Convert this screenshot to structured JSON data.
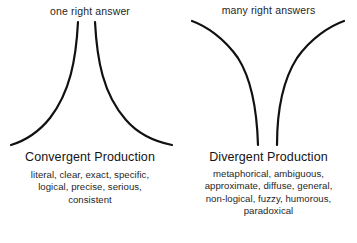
{
  "diagram": {
    "background_color": "#ffffff",
    "stroke_color": "#111111",
    "text_color": "#1f1f1f",
    "panels": [
      {
        "id": "convergent",
        "top_caption": "one right answer",
        "heading": "Convergent Production",
        "shape": "two curves converging to a narrow neck at the top and flaring wide at the bottom",
        "description_lines": [
          "literal, clear, exact, specific,",
          "logical, precise, serious,",
          "consistent"
        ],
        "description_terms": [
          "literal",
          "clear",
          "exact",
          "specific",
          "logical",
          "precise",
          "serious",
          "consistent"
        ]
      },
      {
        "id": "divergent",
        "top_caption": "many right answers",
        "heading": "Divergent Production",
        "shape": "two curves flaring wide at the top and converging to a narrow neck at the bottom",
        "description_lines": [
          "metaphorical, ambiguous,",
          "approximate, diffuse, general,",
          "non-logical, fuzzy, humorous,",
          "paradoxical"
        ],
        "description_terms": [
          "metaphorical",
          "ambiguous",
          "approximate",
          "diffuse",
          "general",
          "non-logical",
          "fuzzy",
          "humorous",
          "paradoxical"
        ]
      }
    ]
  }
}
